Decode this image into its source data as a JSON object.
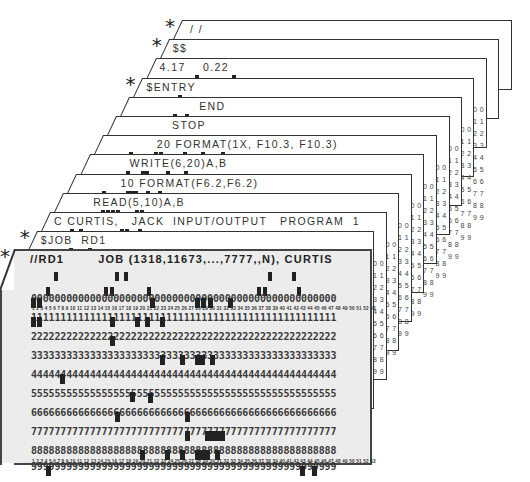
{
  "deck": {
    "cards_back_to_front": [
      {
        "label": "/ /",
        "starred": true
      },
      {
        "label": "$$",
        "starred": true
      },
      {
        "label": "4.17    0.22",
        "starred": false
      },
      {
        "label": "$ENTRY",
        "starred": true
      },
      {
        "label": "END",
        "starred": false
      },
      {
        "label": "STOP",
        "starred": false
      },
      {
        "label": "20 FORMAT(1X, F10.3, F10.3)",
        "starred": false
      },
      {
        "label": "WRITE(6,20)A,B",
        "starred": false
      },
      {
        "label": "10 FORMAT(F6.2,F6.2)",
        "starred": false
      },
      {
        "label": "READ(5,10)A,B",
        "starred": false
      },
      {
        "label": "C CURTIS,   JACK  INPUT/OUTPUT   PROGRAM  1",
        "starred": false
      },
      {
        "label": "$JOB  RD1",
        "starred": true
      }
    ],
    "front_card": {
      "label": "//RD1        JOB (1318,11673,...,7777,,N), CURTIS",
      "starred": true,
      "rows": [
        "0000000000000000000000000000000000000000000000000000",
        "1111111111111111111111111111111111111111111111111111",
        "2222222222222222222222222222222222222222222222222222",
        "3333333333333333333333333333333333333333333333333333",
        "4444444444444444444444444444444444444444444444444444",
        "5555555555555555555555555555555555555555555555555555",
        "6666666666666666666666666666666666666666666666666666",
        "7777777777777777777777777777777777777777777777777777",
        "8888888888888888888888888888888888888888888888888888",
        "9999999999999999999999999999999999999999999999999999"
      ],
      "column_numbers": "1 2 3 4 5 6 7 8 9 10 11 12 13 14 15 16 17 18 19 20 21 22 23 24 25 26 27 28 29 30 31 32 33 34 35 36 37 38 39 40 41 42 43 44 45 46 47 48 49 50 51 52 53"
    },
    "edge_digits": "0 0\n1 1\n2 2\n3 3\n4 4\n5 5\n6 6\n7 7\n8 8\n9 9",
    "edge_tiny": "5354",
    "star_glyph": "*"
  }
}
